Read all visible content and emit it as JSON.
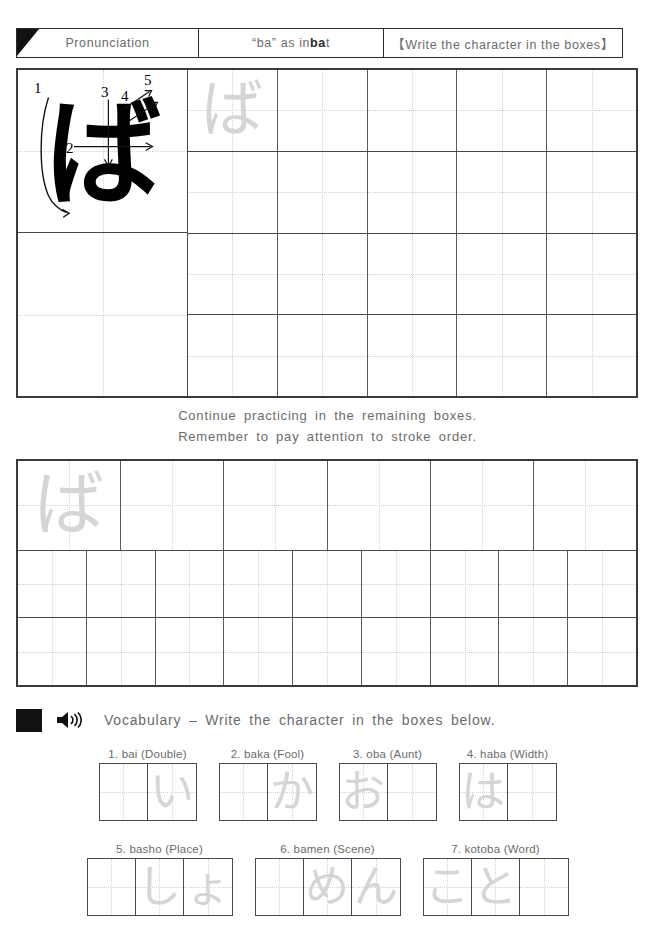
{
  "header": {
    "pronunciation_label": "Pronunciation",
    "reading_prefix": "“ba” as in ",
    "reading_bold": "ba",
    "reading_suffix": "t",
    "instruction_bracket": "【Write the character in the boxes】"
  },
  "character": {
    "glyph": "ば",
    "romaji": "ba",
    "stroke_numbers": [
      "1",
      "2",
      "3",
      "4",
      "5"
    ],
    "stroke_count": 5
  },
  "instructions": {
    "line1": "Continue practicing in the remaining boxes.",
    "line2": "Remember to pay attention to stroke order."
  },
  "vocabulary": {
    "square_icon": "black-square-icon",
    "speaker_icon": "speaker-icon",
    "title": "Vocabulary – Write the character in the boxes below.",
    "row1": [
      {
        "label": "1. bai (Double)",
        "boxes": [
          "",
          "い"
        ]
      },
      {
        "label": "2. baka (Fool)",
        "boxes": [
          "",
          "か"
        ]
      },
      {
        "label": "3. oba (Aunt)",
        "boxes": [
          "お",
          ""
        ]
      },
      {
        "label": "4. haba (Width)",
        "boxes": [
          "は",
          ""
        ]
      }
    ],
    "row2": [
      {
        "label": "5. basho (Place)",
        "boxes": [
          "",
          "し",
          "ょ"
        ]
      },
      {
        "label": "6. bamen (Scene)",
        "boxes": [
          "",
          "め",
          "ん"
        ]
      },
      {
        "label": "7. kotoba (Word)",
        "boxes": [
          "こ",
          "と",
          ""
        ]
      }
    ]
  },
  "grid": {
    "main_rows": 4,
    "main_cols": 5,
    "second_big_cols": 6,
    "second_small_cols": 9,
    "trace_char": "ば"
  },
  "colors": {
    "ink": "#111111",
    "border": "#3a3a3a",
    "trace_gray": "#d5d5d5",
    "text_gray": "#6b6b6b"
  }
}
